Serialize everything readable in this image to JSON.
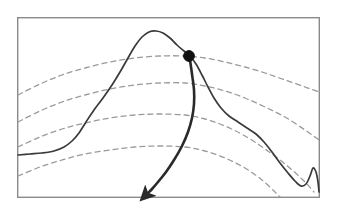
{
  "figure": {
    "background_color": "#ffffff",
    "frame": {
      "name": "plot-frame",
      "x": 17,
      "y": 17,
      "width": 303,
      "height": 181,
      "stroke_color": "#8a8a8a",
      "stroke_width": 1.4,
      "fill": "none"
    },
    "solid_curve": {
      "name": "profile-curve",
      "stroke_color": "#3a3a3a",
      "stroke_width": 1.7,
      "dash": "none",
      "points": [
        [
          18,
          155
        ],
        [
          30,
          154
        ],
        [
          42,
          153
        ],
        [
          54,
          151
        ],
        [
          64,
          147
        ],
        [
          72,
          141
        ],
        [
          79,
          133
        ],
        [
          86,
          122
        ],
        [
          94,
          110
        ],
        [
          103,
          98
        ],
        [
          112,
          85
        ],
        [
          120,
          72
        ],
        [
          128,
          58
        ],
        [
          135,
          46
        ],
        [
          142,
          37
        ],
        [
          149,
          32
        ],
        [
          156,
          31
        ],
        [
          163,
          33
        ],
        [
          170,
          38
        ],
        [
          177,
          45
        ],
        [
          184,
          51
        ],
        [
          190,
          56
        ],
        [
          196,
          64
        ],
        [
          202,
          75
        ],
        [
          208,
          87
        ],
        [
          214,
          98
        ],
        [
          221,
          108
        ],
        [
          229,
          116
        ],
        [
          238,
          122
        ],
        [
          247,
          128
        ],
        [
          256,
          134
        ],
        [
          264,
          142
        ],
        [
          272,
          152
        ],
        [
          280,
          163
        ],
        [
          288,
          173
        ],
        [
          295,
          181
        ],
        [
          301,
          186
        ],
        [
          306,
          184
        ],
        [
          310,
          176
        ],
        [
          313,
          168
        ],
        [
          316,
          172
        ],
        [
          318,
          182
        ],
        [
          319,
          192
        ]
      ]
    },
    "dashed_contours": {
      "name": "contour-arcs",
      "stroke_color": "#9a9a9a",
      "stroke_width": 1.3,
      "dash_pattern": "5 4",
      "count": 4,
      "arcs": [
        {
          "id": "contour-1",
          "label": "uppermost arc through marker",
          "points": [
            [
              18,
              95
            ],
            [
              40,
              84
            ],
            [
              62,
              75
            ],
            [
              85,
              68
            ],
            [
              110,
              62
            ],
            [
              135,
              58
            ],
            [
              160,
              56
            ],
            [
              185,
              56
            ],
            [
              205,
              58
            ],
            [
              225,
              62
            ],
            [
              245,
              67
            ],
            [
              265,
              73
            ],
            [
              285,
              80
            ],
            [
              305,
              87
            ],
            [
              319,
              92
            ]
          ]
        },
        {
          "id": "contour-2",
          "label": "second arc",
          "points": [
            [
              18,
              122
            ],
            [
              40,
              111
            ],
            [
              62,
              102
            ],
            [
              85,
              95
            ],
            [
              110,
              89
            ],
            [
              135,
              85
            ],
            [
              160,
              83
            ],
            [
              185,
              83
            ],
            [
              205,
              86
            ],
            [
              225,
              91
            ],
            [
              245,
              98
            ],
            [
              265,
              107
            ],
            [
              285,
              117
            ],
            [
              305,
              130
            ],
            [
              319,
              140
            ]
          ]
        },
        {
          "id": "contour-3",
          "label": "third arc",
          "points": [
            [
              18,
              147
            ],
            [
              40,
              137
            ],
            [
              62,
              129
            ],
            [
              85,
              123
            ],
            [
              110,
              118
            ],
            [
              135,
              115
            ],
            [
              160,
              114
            ],
            [
              185,
              115
            ],
            [
              205,
              119
            ],
            [
              225,
              126
            ],
            [
              245,
              136
            ],
            [
              265,
              149
            ],
            [
              285,
              164
            ],
            [
              303,
              180
            ],
            [
              314,
              192
            ]
          ]
        },
        {
          "id": "contour-4",
          "label": "lowest arc",
          "points": [
            [
              18,
              176
            ],
            [
              40,
              167
            ],
            [
              62,
              160
            ],
            [
              85,
              154
            ],
            [
              110,
              150
            ],
            [
              135,
              147
            ],
            [
              160,
              146
            ],
            [
              185,
              147
            ],
            [
              205,
              151
            ],
            [
              225,
              158
            ],
            [
              245,
              168
            ],
            [
              262,
              180
            ],
            [
              275,
              192
            ],
            [
              280,
              197
            ]
          ]
        }
      ]
    },
    "marker": {
      "name": "intersection-dot",
      "shape": "filled-circle",
      "cx": 189,
      "cy": 56,
      "r": 5.4,
      "fill_color": "#111111",
      "stroke_color": "#111111"
    },
    "arrow": {
      "name": "descent-arrow",
      "stroke_color": "#2a2a2a",
      "stroke_width": 2.6,
      "head_length": 11,
      "head_width": 8,
      "points": [
        [
          190,
          60
        ],
        [
          192,
          74
        ],
        [
          194,
          90
        ],
        [
          194,
          104
        ],
        [
          192,
          118
        ],
        [
          188,
          132
        ],
        [
          182,
          146
        ],
        [
          174,
          160
        ],
        [
          166,
          172
        ],
        [
          158,
          182
        ],
        [
          152,
          189
        ],
        [
          148,
          193
        ]
      ],
      "tip": [
        145,
        196
      ],
      "direction": "down-left"
    }
  },
  "chart_data": {
    "type": "line",
    "xlabel": "",
    "ylabel": "",
    "grid": false,
    "legend": "none",
    "xlim": [
      17,
      320
    ],
    "ylim": [
      198,
      17
    ],
    "series": [
      {
        "name": "profile-curve",
        "style": "solid",
        "color": "#3a3a3a"
      },
      {
        "name": "contour-1",
        "style": "dashed",
        "color": "#9a9a9a"
      },
      {
        "name": "contour-2",
        "style": "dashed",
        "color": "#9a9a9a"
      },
      {
        "name": "contour-3",
        "style": "dashed",
        "color": "#9a9a9a"
      },
      {
        "name": "contour-4",
        "style": "dashed",
        "color": "#9a9a9a"
      },
      {
        "name": "descent-arrow",
        "style": "solid-thick-arrow",
        "color": "#2a2a2a"
      }
    ],
    "annotations": [
      {
        "name": "intersection-dot",
        "type": "point-marker",
        "x": 189,
        "y": 56
      },
      {
        "name": "descent-arrow",
        "type": "arrow",
        "from_x": 190,
        "from_y": 60,
        "to_x": 145,
        "to_y": 196
      }
    ]
  }
}
